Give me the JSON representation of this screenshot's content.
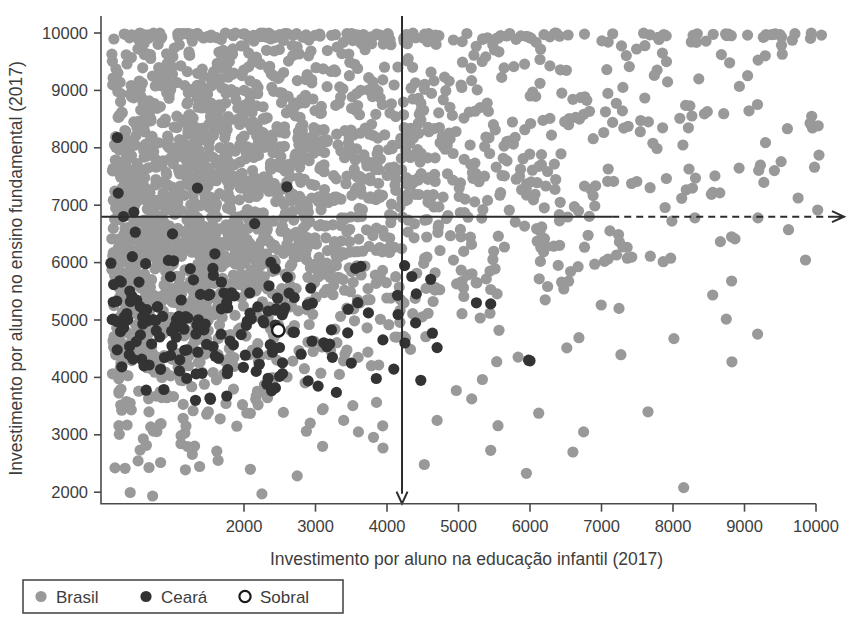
{
  "chart_data": {
    "type": "scatter",
    "title": "",
    "xlabel": "Investimento por aluno na educação infantil (2017)",
    "ylabel": "Investimento por aluno no ensino fundamental (2017)",
    "xlim": [
      0,
      10200
    ],
    "ylim": [
      1700,
      10150
    ],
    "xticks": [
      2000,
      3000,
      4000,
      5000,
      6000,
      7000,
      8000,
      9000,
      10000
    ],
    "xtick_labels": [
      "2000",
      "3000",
      "4000",
      "5000",
      "6000",
      "7000",
      "8000",
      "9000",
      "10000"
    ],
    "yticks": [
      2000,
      3000,
      4000,
      5000,
      6000,
      7000,
      8000,
      9000,
      10000
    ],
    "ytick_labels": [
      "2000",
      "3000",
      "4000",
      "5000",
      "6000",
      "7000",
      "8000",
      "9000",
      "10000"
    ],
    "grid": false,
    "legend_position": "below-left",
    "reference_lines": {
      "horizontal_y": 6800,
      "vertical_x": 4210,
      "horizontal_style": "solid-then-dashed-with-arrow",
      "vertical_style": "solid-with-down-arrow"
    },
    "series": [
      {
        "name": "Brasil",
        "color": "#999999",
        "marker": "filled-circle",
        "marker_size": 11,
        "n_points": 2400,
        "note": "Dense cloud of Brazilian municipalities, saturated/clipped at y=10000 and spread across full x range"
      },
      {
        "name": "Ceará",
        "color": "#333333",
        "marker": "filled-circle",
        "marker_size": 11,
        "n_points": 184,
        "note": "Concentrated at low-to-mid investment in early childhood with fundamental investment mostly 4000-6000"
      },
      {
        "name": "Sobral",
        "color": "#ffffff",
        "edge_color": "#1a1a1a",
        "marker": "open-circle",
        "marker_size": 11,
        "n_points": 1,
        "point": {
          "x": 2480,
          "y": 4820
        }
      }
    ]
  },
  "legend": {
    "entries": [
      {
        "label": "Brasil",
        "marker": "filled-circle",
        "color": "#999999"
      },
      {
        "label": "Ceará",
        "marker": "filled-circle",
        "color": "#333333"
      },
      {
        "label": "Sobral",
        "marker": "open-circle",
        "color": "#ffffff"
      }
    ]
  },
  "axes": {
    "x_title": "Investimento por aluno na educação infantil (2017)",
    "y_title": "Investimento por aluno no ensino fundamental (2017)",
    "x_tick_labels": [
      "2000",
      "3000",
      "4000",
      "5000",
      "6000",
      "7000",
      "8000",
      "9000",
      "10000"
    ],
    "y_tick_labels": [
      "10000",
      "9000",
      "8000",
      "7000",
      "6000",
      "5000",
      "4000",
      "3000",
      "2000"
    ]
  },
  "colors": {
    "brasil": "#999999",
    "ceara": "#333333",
    "sobral_fill": "#ffffff",
    "sobral_edge": "#1a1a1a",
    "axis": "#4a4a4a",
    "text": "#3d3d3d",
    "reference_line": "#2c2c2c"
  }
}
